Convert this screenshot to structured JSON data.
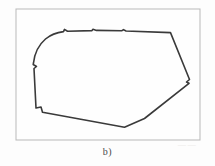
{
  "figure": {
    "caption": "b)",
    "frame": {
      "x": 16,
      "y": 9,
      "width": 184,
      "height": 131,
      "stroke_color": "#b9b9b9",
      "fill_color": "#fefefe"
    },
    "background_color": "#fdfdfd",
    "outline": {
      "name": "closed-polygon-contour",
      "stroke_color": "#3a3a3a",
      "stroke_width": 1.6,
      "path": "M 33.5 63.0 C 34.5 54.0 38.5 45.0 45.5 39.0 C 50.5 34.8 56.5 32.4 63.5 31.6 L 64.5 29.4 L 67.5 31.2 L 92.0 30.6 L 93.0 29.3 L 96.5 30.4 L 122.0 30.7 L 123.5 29.6 L 126.0 31.0 L 170.5 32.6 L 189.5 79.5 L 186.5 82.0 L 189.0 83.3 L 144.5 118.5 L 124.5 127.3 L 42.5 112.2 L 41.0 107.0 L 36.0 108.0 L 34.0 68.5 L 36.5 66.5 L 33.2 64.5 Z"
    },
    "watermarks": [
      {
        "text": "──── ────",
        "x": 72,
        "y": 62,
        "opacity": 0.55
      },
      {
        "text": "─ ─ ─ ─ ─ ─",
        "x": 26,
        "y": 98,
        "opacity": 0.5
      },
      {
        "text": "──",
        "x": 178,
        "y": 150,
        "opacity": 0.45
      }
    ]
  }
}
